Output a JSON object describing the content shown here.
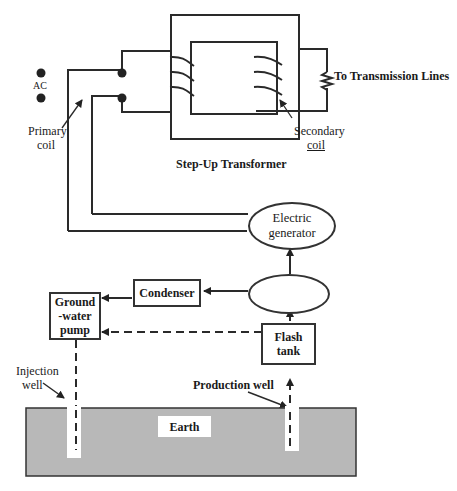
{
  "diagram": {
    "type": "geothermal flash steam power plant schematic",
    "transformer": {
      "title": "Step-Up Transformer",
      "primary_coil_label_line1": "Primary",
      "primary_coil_label_line2": "coil",
      "secondary_coil_label_line1": "Secondary",
      "secondary_coil_label_line2": "coil",
      "ac_label": "AC",
      "output_label": "To Transmission Lines"
    },
    "components": {
      "generator_line1": "Electric",
      "generator_line2": "generator",
      "turbine_label": "",
      "condenser": "Condenser",
      "pump_line1": "Ground",
      "pump_line2": "-water",
      "pump_line3": "pump",
      "flash_tank_line1": "Flash",
      "flash_tank_line2": "tank"
    },
    "wells": {
      "injection_line1": "Injection",
      "injection_line2": "well",
      "production": "Production well"
    },
    "ground": {
      "label": "Earth",
      "fill_color": "#b8b8b8"
    },
    "flows": [
      {
        "from": "flash_tank",
        "to": "turbine",
        "style": "solid"
      },
      {
        "from": "turbine",
        "to": "generator",
        "style": "solid"
      },
      {
        "from": "turbine",
        "to": "condenser",
        "style": "solid"
      },
      {
        "from": "condenser",
        "to": "pump",
        "style": "solid"
      },
      {
        "from": "flash_tank",
        "to": "pump",
        "style": "dashed"
      },
      {
        "from": "pump",
        "to": "injection_well",
        "style": "dashed"
      },
      {
        "from": "production_well",
        "to": "flash_tank",
        "style": "dashed"
      },
      {
        "from": "generator",
        "to": "transformer_primary",
        "style": "wire"
      }
    ]
  }
}
